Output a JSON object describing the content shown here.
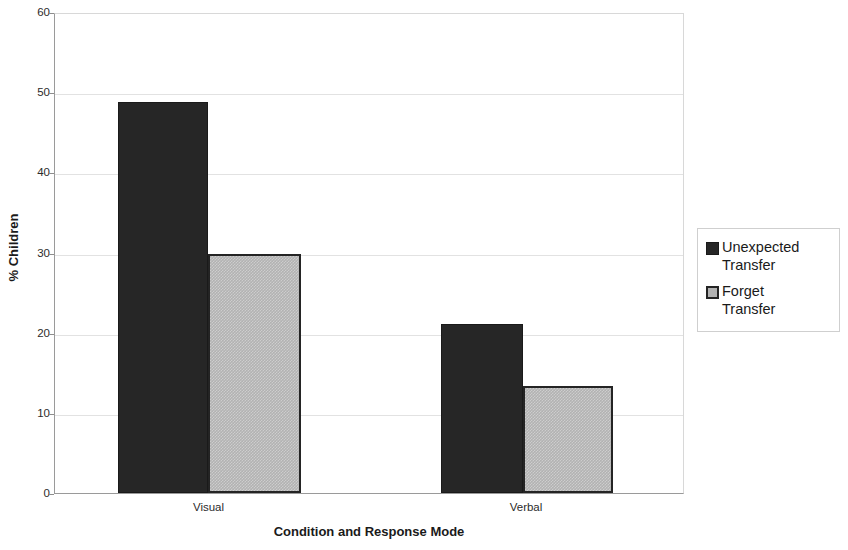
{
  "chart_data": {
    "type": "bar",
    "title": "",
    "subtitle": "",
    "xlabel": "Condition and Response Mode",
    "ylabel": "% Children",
    "categories": [
      "Visual",
      "Verbal"
    ],
    "series": [
      {
        "name": "Unexpected Transfer",
        "values": [
          48.8,
          21.1
        ],
        "color": "#262626"
      },
      {
        "name": "Forget Transfer",
        "values": [
          29.8,
          13.3
        ],
        "color": "#b2b2b2"
      }
    ],
    "ylim": [
      0,
      60
    ],
    "yticks": [
      0,
      10,
      20,
      30,
      40,
      50,
      60
    ],
    "ytick_labels": [
      "0",
      "10",
      "20",
      "30",
      "40",
      "50",
      "60"
    ],
    "grid": true,
    "grid_axis": "y",
    "legend_position": "right",
    "legend": [
      {
        "label": "Unexpected\nTransfer",
        "swatch": "#262626"
      },
      {
        "label": "Forget\nTransfer",
        "swatch": "#b2b2b2"
      }
    ],
    "bar_edge_color": "#1f1f1f",
    "plot_background": "#ffffff"
  }
}
